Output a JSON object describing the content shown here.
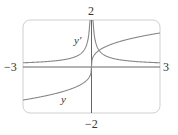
{
  "figure": {
    "xmin": -3,
    "xmax": 3,
    "ymin": -2,
    "ymax": 2,
    "labels": {
      "xmin": "−3",
      "xmax": "3",
      "ymin": "−2",
      "ymax": "2",
      "y_curve": "y",
      "yprime_curve": "y′"
    },
    "curves": [
      {
        "name": "y",
        "expression": "x^(1/3)"
      },
      {
        "name": "y′",
        "expression": "1/(3x^(2/3))"
      }
    ],
    "colors": {
      "frame": "#cccccc",
      "axes": "#666666",
      "curve": "#888888",
      "text": "#333333"
    }
  }
}
